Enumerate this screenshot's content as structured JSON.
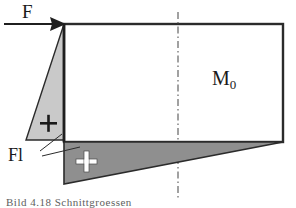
{
  "figure": {
    "labels": {
      "force": "F",
      "moment": "M",
      "moment_subscript": "0",
      "reaction": "Fl",
      "plus_sign_upper": "+",
      "plus_sign_lower": "+",
      "bottom_caption": "Bild 4.18  Schnittgroessen"
    },
    "colors": {
      "line": "#1a1a1a",
      "light_fill": "#c9c9c9",
      "dark_fill": "#8f8f8f",
      "background": "#ffffff",
      "centerline": "#4d4d4d",
      "plus_upper": "#1a1a1a",
      "plus_lower": "#ffffff"
    },
    "geometry": {
      "rectangle": {
        "x": 64,
        "y": 24,
        "width": 219,
        "height": 118
      },
      "force_arrow": {
        "x1": 6,
        "y1": 24,
        "x2": 64,
        "y2": 24,
        "direction": "right"
      },
      "upper_triangle": {
        "points": "64,24 64,140 26,140"
      },
      "lower_triangle": {
        "points": "64,142 283,142 64,184"
      },
      "centerline": {
        "x": 178,
        "y1": 12,
        "y2": 200,
        "style": "dash-dot"
      },
      "leader_lines": [
        {
          "x1": 40,
          "y1": 152,
          "x2": 60,
          "y2": 136
        },
        {
          "x1": 40,
          "y1": 155,
          "x2": 78,
          "y2": 146
        }
      ]
    }
  }
}
